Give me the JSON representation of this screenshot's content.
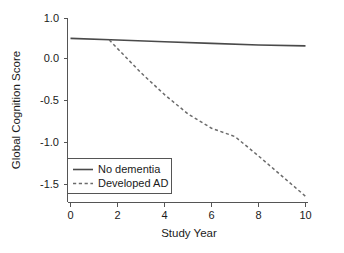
{
  "chart_data": {
    "type": "line",
    "title": "",
    "xlabel": "Study Year",
    "ylabel": "Global Cognition Score",
    "xlim": [
      0,
      10
    ],
    "ylim": [
      -1.75,
      1.0
    ],
    "xticks": [
      "0",
      "2",
      "4",
      "6",
      "8",
      "10"
    ],
    "xtick_values": [
      0,
      2,
      4,
      6,
      8,
      10
    ],
    "yticks": [
      "1.0",
      "0.0",
      "-0.5",
      "-1.0",
      "-1.5"
    ],
    "ytick_values": [
      1.0,
      0.0,
      -0.5,
      -1.0,
      -1.5
    ],
    "grid": false,
    "legend_position": "lower left",
    "series": [
      {
        "name": "No dementia",
        "style": "solid",
        "color": "#4a4a4a",
        "x": [
          0,
          2,
          4,
          6,
          8,
          10
        ],
        "values": [
          0.24,
          0.22,
          0.2,
          0.18,
          0.16,
          0.15
        ]
      },
      {
        "name": "Developed AD",
        "style": "dashed",
        "color": "#6b6b6b",
        "x": [
          1.65,
          3,
          4,
          5,
          6,
          7,
          8,
          9,
          10
        ],
        "values": [
          0.22,
          -0.17,
          -0.43,
          -0.66,
          -0.83,
          -0.93,
          -1.16,
          -1.4,
          -1.64
        ]
      }
    ]
  },
  "axes": {
    "y_title": "Global Cognition Score",
    "x_title": "Study Year",
    "y_tick_labels": [
      "1.0",
      "0.0",
      "-0.5",
      "-1.0",
      "-1.5"
    ],
    "x_tick_labels": [
      "0",
      "2",
      "4",
      "6",
      "8",
      "10"
    ]
  },
  "legend": {
    "entries": [
      {
        "label": "No dementia",
        "style": "solid"
      },
      {
        "label": "Developed AD",
        "style": "dashed"
      }
    ]
  }
}
